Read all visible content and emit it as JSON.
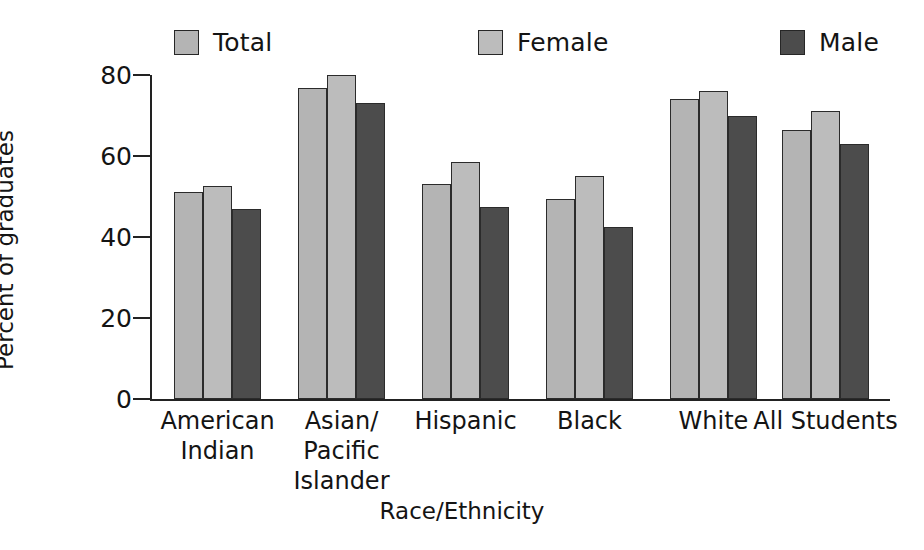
{
  "chart_data": {
    "type": "bar",
    "title": "",
    "xlabel": "Race/Ethnicity",
    "ylabel": "Percent of graduates",
    "ylim": [
      0,
      80
    ],
    "yticks": [
      0,
      20,
      40,
      60,
      80
    ],
    "ytick_labels": [
      "0",
      "20",
      "40",
      "60",
      "80"
    ],
    "grid": false,
    "legend_position": "top",
    "categories": [
      "American Indian",
      "Asian/ Pacific Islander",
      "Hispanic",
      "Black",
      "White",
      "All Students"
    ],
    "category_lines": [
      [
        "American",
        "Indian"
      ],
      [
        "Asian/",
        "Pacific",
        "Islander"
      ],
      [
        "Hispanic"
      ],
      [
        "Black"
      ],
      [
        "White"
      ],
      [
        "All Students"
      ]
    ],
    "series": [
      {
        "name": "Total",
        "color": "#b4b4b4",
        "values": [
          51.0,
          76.8,
          53.0,
          49.5,
          74.0,
          66.5
        ]
      },
      {
        "name": "Female",
        "color": "#bcbcbc",
        "values": [
          52.5,
          80.0,
          58.5,
          55.0,
          76.0,
          71.0
        ]
      },
      {
        "name": "Male",
        "color": "#4c4c4c",
        "values": [
          47.0,
          73.0,
          47.5,
          42.5,
          70.0,
          63.0
        ]
      }
    ]
  },
  "legend": {
    "items": [
      {
        "label": "Total",
        "color": "#b4b4b4"
      },
      {
        "label": "Female",
        "color": "#bcbcbc"
      },
      {
        "label": "Male",
        "color": "#4c4c4c"
      }
    ]
  },
  "axes": {
    "y_title": "Percent of graduates",
    "x_title": "Race/Ethnicity",
    "y_tick_0": "0",
    "y_tick_1": "20",
    "y_tick_2": "40",
    "y_tick_3": "60",
    "y_tick_4": "80"
  }
}
